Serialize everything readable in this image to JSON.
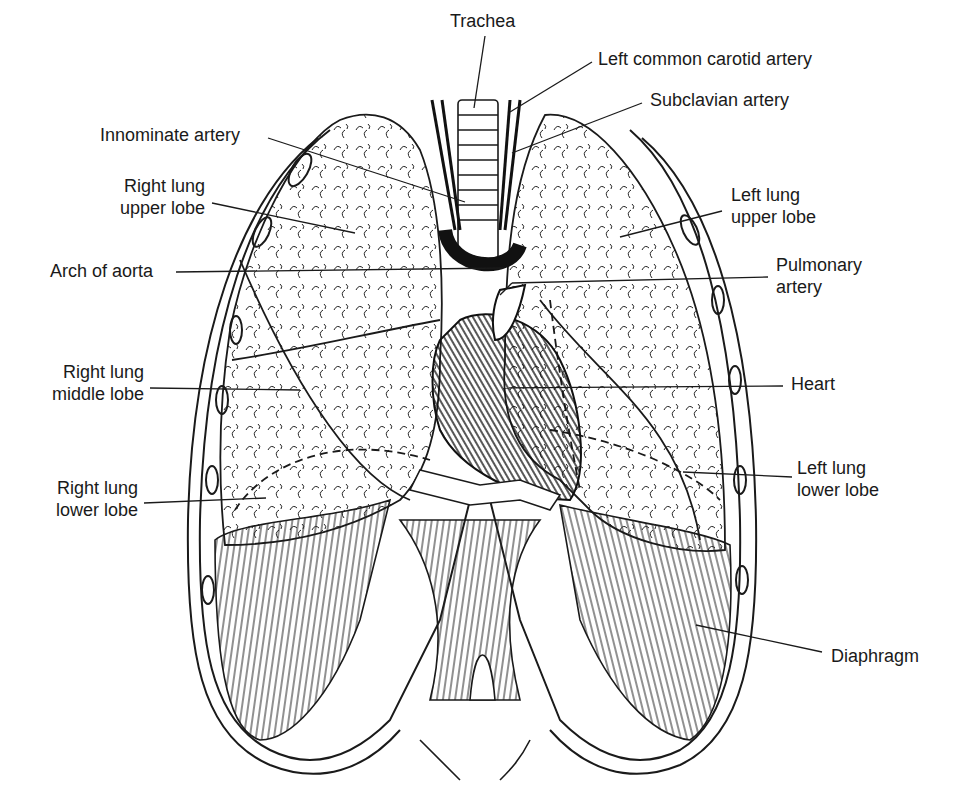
{
  "diagram": {
    "colors": {
      "ink": "#1a1a1a",
      "background": "#ffffff"
    },
    "labels": {
      "trachea": {
        "lines": [
          "Trachea"
        ]
      },
      "left_common_carotid": {
        "lines": [
          "Left common carotid artery"
        ]
      },
      "subclavian": {
        "lines": [
          "Subclavian artery"
        ]
      },
      "innominate": {
        "lines": [
          "Innominate artery"
        ]
      },
      "right_upper": {
        "lines": [
          "Right lung",
          "upper lobe"
        ]
      },
      "left_upper": {
        "lines": [
          "Left lung",
          "upper lobe"
        ]
      },
      "arch_aorta": {
        "lines": [
          "Arch of aorta"
        ]
      },
      "pulmonary": {
        "lines": [
          "Pulmonary",
          "artery"
        ]
      },
      "right_middle": {
        "lines": [
          "Right lung",
          "middle lobe"
        ]
      },
      "heart": {
        "lines": [
          "Heart"
        ]
      },
      "left_lower": {
        "lines": [
          "Left lung",
          "lower lobe"
        ]
      },
      "right_lower": {
        "lines": [
          "Right lung",
          "lower lobe"
        ]
      },
      "diaphragm": {
        "lines": [
          "Diaphragm"
        ]
      }
    }
  }
}
